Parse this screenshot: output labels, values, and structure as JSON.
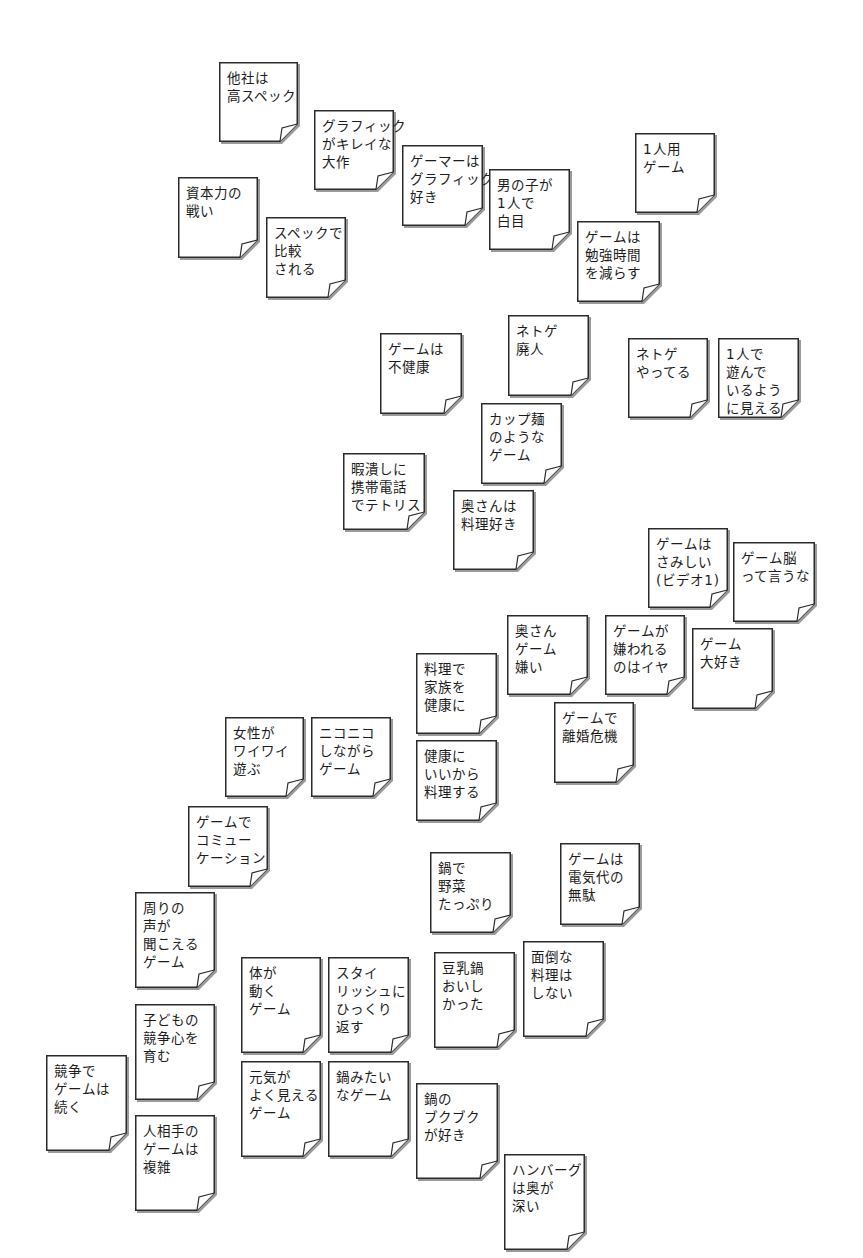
{
  "board": {
    "title": "",
    "notes": [
      {
        "id": "n01",
        "x": 219,
        "y": 62,
        "w": 79,
        "h": 80,
        "lines": [
          "他社は",
          "高スペック"
        ]
      },
      {
        "id": "n02",
        "x": 314,
        "y": 110,
        "w": 80,
        "h": 80,
        "lines": [
          "グラフィック",
          "がキレイな",
          "大作"
        ]
      },
      {
        "id": "n03",
        "x": 402,
        "y": 145,
        "w": 81,
        "h": 81,
        "lines": [
          "ゲーマーは",
          "グラフィック",
          "好き"
        ]
      },
      {
        "id": "n04",
        "x": 489,
        "y": 169,
        "w": 81,
        "h": 81,
        "lines": [
          "男の子が",
          "1人で",
          "白目"
        ]
      },
      {
        "id": "n05",
        "x": 635,
        "y": 133,
        "w": 80,
        "h": 80,
        "lines": [
          "1人用",
          "ゲーム"
        ]
      },
      {
        "id": "n06",
        "x": 178,
        "y": 177,
        "w": 80,
        "h": 81,
        "lines": [
          "資本力の",
          "戦い"
        ]
      },
      {
        "id": "n07",
        "x": 266,
        "y": 217,
        "w": 80,
        "h": 81,
        "lines": [
          "スペックで",
          "比較",
          "される"
        ]
      },
      {
        "id": "n08",
        "x": 577,
        "y": 221,
        "w": 83,
        "h": 81,
        "lines": [
          "ゲームは",
          "勉強時間",
          "を減らす"
        ]
      },
      {
        "id": "n09",
        "x": 380,
        "y": 333,
        "w": 82,
        "h": 81,
        "lines": [
          "ゲームは",
          "不健康"
        ]
      },
      {
        "id": "n10",
        "x": 508,
        "y": 315,
        "w": 81,
        "h": 81,
        "lines": [
          "ネトゲ",
          "廃人"
        ]
      },
      {
        "id": "n11",
        "x": 628,
        "y": 338,
        "w": 80,
        "h": 80,
        "lines": [
          "ネトゲ",
          "やってる"
        ]
      },
      {
        "id": "n12",
        "x": 718,
        "y": 338,
        "w": 81,
        "h": 80,
        "lines": [
          "1人で",
          "遊んで",
          "いるよう",
          "に見える"
        ]
      },
      {
        "id": "n13",
        "x": 481,
        "y": 403,
        "w": 81,
        "h": 81,
        "lines": [
          "カップ麺",
          "のような",
          "ゲーム"
        ]
      },
      {
        "id": "n14",
        "x": 343,
        "y": 453,
        "w": 82,
        "h": 77,
        "lines": [
          "暇潰しに",
          "携帯電話",
          "でテトリス"
        ]
      },
      {
        "id": "n15",
        "x": 453,
        "y": 490,
        "w": 81,
        "h": 80,
        "lines": [
          "奥さんは",
          "料理好き"
        ]
      },
      {
        "id": "n16",
        "x": 648,
        "y": 528,
        "w": 80,
        "h": 80,
        "lines": [
          "ゲームは",
          "さみしい",
          "(ビデオ1)"
        ]
      },
      {
        "id": "n17",
        "x": 733,
        "y": 542,
        "w": 82,
        "h": 80,
        "lines": [
          "ゲーム脳",
          "って言うな"
        ]
      },
      {
        "id": "n18",
        "x": 507,
        "y": 615,
        "w": 81,
        "h": 80,
        "lines": [
          "奥さん",
          "ゲーム",
          "嫌い"
        ]
      },
      {
        "id": "n19",
        "x": 605,
        "y": 615,
        "w": 80,
        "h": 80,
        "lines": [
          "ゲームが",
          "嫌われる",
          "のはイヤ"
        ]
      },
      {
        "id": "n20",
        "x": 692,
        "y": 628,
        "w": 81,
        "h": 81,
        "lines": [
          "ゲーム",
          "大好き"
        ]
      },
      {
        "id": "n21",
        "x": 416,
        "y": 653,
        "w": 81,
        "h": 81,
        "lines": [
          "料理で",
          "家族を",
          "健康に"
        ]
      },
      {
        "id": "n22",
        "x": 554,
        "y": 702,
        "w": 80,
        "h": 81,
        "lines": [
          "ゲームで",
          "離婚危機"
        ]
      },
      {
        "id": "n23",
        "x": 225,
        "y": 717,
        "w": 79,
        "h": 80,
        "lines": [
          "女性が",
          "ワイワイ",
          "遊ぶ"
        ]
      },
      {
        "id": "n24",
        "x": 311,
        "y": 717,
        "w": 80,
        "h": 80,
        "lines": [
          "ニコニコ",
          "しながら",
          "ゲーム"
        ]
      },
      {
        "id": "n25",
        "x": 416,
        "y": 740,
        "w": 81,
        "h": 81,
        "lines": [
          "健康に",
          "いいから",
          "料理する"
        ]
      },
      {
        "id": "n26",
        "x": 188,
        "y": 806,
        "w": 80,
        "h": 81,
        "lines": [
          "ゲームで",
          "コミュー",
          "ケーション"
        ]
      },
      {
        "id": "n27",
        "x": 430,
        "y": 852,
        "w": 81,
        "h": 81,
        "lines": [
          "鍋で",
          "野菜",
          "たっぷり"
        ]
      },
      {
        "id": "n28",
        "x": 560,
        "y": 843,
        "w": 80,
        "h": 82,
        "lines": [
          "ゲームは",
          "電気代の",
          "無駄"
        ]
      },
      {
        "id": "n29",
        "x": 135,
        "y": 892,
        "w": 80,
        "h": 96,
        "lines": [
          "周りの",
          "声が",
          "聞こえる",
          "ゲーム"
        ]
      },
      {
        "id": "n30",
        "x": 523,
        "y": 941,
        "w": 81,
        "h": 96,
        "lines": [
          "面倒な",
          "料理は",
          "しない"
        ]
      },
      {
        "id": "n31",
        "x": 434,
        "y": 952,
        "w": 81,
        "h": 96,
        "lines": [
          "豆乳鍋",
          "おいし",
          "かった"
        ]
      },
      {
        "id": "n32",
        "x": 241,
        "y": 957,
        "w": 80,
        "h": 96,
        "lines": [
          "体が",
          "動く",
          "ゲーム"
        ]
      },
      {
        "id": "n33",
        "x": 328,
        "y": 957,
        "w": 81,
        "h": 96,
        "lines": [
          "スタイ",
          "リッシュに",
          "ひっくり",
          "返す"
        ]
      },
      {
        "id": "n34",
        "x": 135,
        "y": 1004,
        "w": 80,
        "h": 96,
        "lines": [
          "子どもの",
          "競争心を",
          "育む"
        ]
      },
      {
        "id": "n35",
        "x": 46,
        "y": 1055,
        "w": 81,
        "h": 96,
        "lines": [
          "競争で",
          "ゲームは",
          "続く"
        ]
      },
      {
        "id": "n36",
        "x": 241,
        "y": 1061,
        "w": 80,
        "h": 96,
        "lines": [
          "元気が",
          "よく見える",
          "ゲーム"
        ]
      },
      {
        "id": "n37",
        "x": 328,
        "y": 1061,
        "w": 81,
        "h": 96,
        "lines": [
          "鍋みたい",
          "なゲーム"
        ]
      },
      {
        "id": "n38",
        "x": 416,
        "y": 1083,
        "w": 82,
        "h": 96,
        "lines": [
          "鍋の",
          "ブクブク",
          "が好き"
        ]
      },
      {
        "id": "n39",
        "x": 135,
        "y": 1115,
        "w": 80,
        "h": 96,
        "lines": [
          "人相手の",
          "ゲームは",
          "複雑"
        ]
      },
      {
        "id": "n40",
        "x": 504,
        "y": 1154,
        "w": 81,
        "h": 96,
        "lines": [
          "ハンバーグ",
          "は奥が",
          "深い"
        ]
      }
    ]
  },
  "colors": {
    "background": "#ffffff",
    "note_fill": "#ffffff",
    "note_border": "#2b2b2b",
    "text": "#1c1c1c"
  }
}
